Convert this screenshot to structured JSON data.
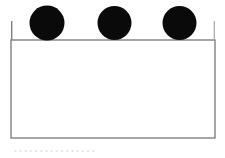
{
  "figure": {
    "background_color": "#ffffff",
    "width": 225,
    "height": 158,
    "rectangle": {
      "name": "container-rectangle",
      "x": 11,
      "y": 40,
      "width": 204,
      "height": 98,
      "fill": "#ffffff",
      "stroke": "#808080",
      "stroke_width": 1.4,
      "top_edge_y": 40,
      "left_edge_overhang_top": 21
    },
    "circles": [
      {
        "name": "circle-1",
        "cx": 47,
        "cy": 23,
        "r": 17.5,
        "fill": "#0a0a0a"
      },
      {
        "name": "circle-2",
        "cx": 114.5,
        "cy": 23,
        "r": 17.0,
        "fill": "#0a0a0a"
      },
      {
        "name": "circle-3",
        "cx": 179.5,
        "cy": 23,
        "r": 17.0,
        "fill": "#0a0a0a"
      }
    ],
    "caption": {
      "name": "figure-caption",
      "text": "• • • • • • • • • • • • • • • •",
      "color": "#e2e2e2",
      "legible": false
    }
  }
}
